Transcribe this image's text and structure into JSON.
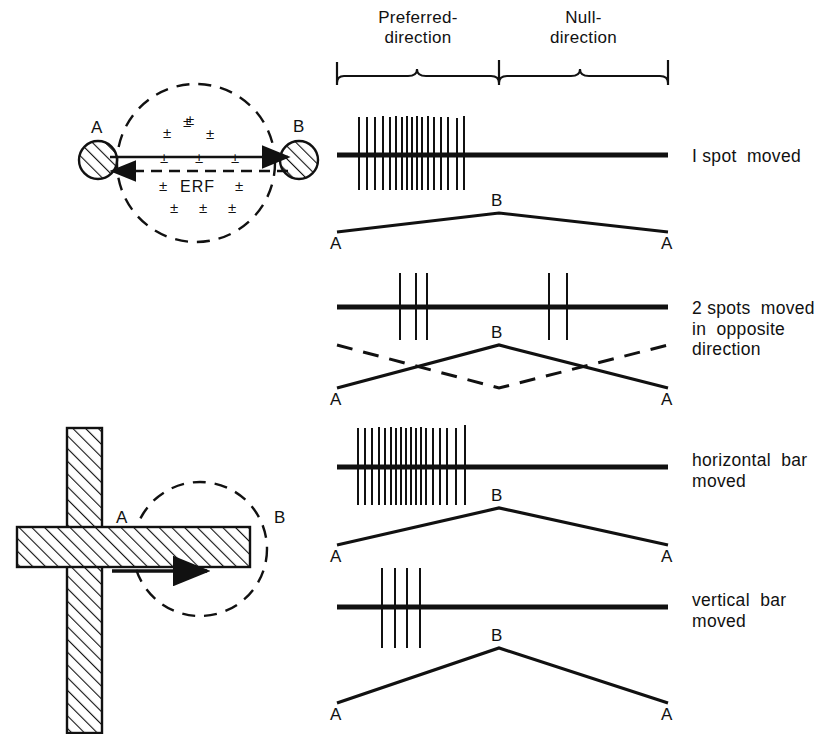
{
  "figure": {
    "header": {
      "preferred_label": "Preferred-\ndirection",
      "null_label": "Null-\ndirection"
    },
    "erf_diagram": {
      "label_a": "A",
      "label_b": "B",
      "erf_text": "ERF",
      "pm_symbol": "±",
      "pm_count": 12,
      "pm_positions": [
        {
          "x": 183,
          "y": 113
        },
        {
          "x": 163,
          "y": 124
        },
        {
          "x": 206,
          "y": 125
        },
        {
          "x": 160,
          "y": 149
        },
        {
          "x": 195,
          "y": 149
        },
        {
          "x": 231,
          "y": 149
        },
        {
          "x": 159,
          "y": 177
        },
        {
          "x": 235,
          "y": 177
        },
        {
          "x": 170,
          "y": 199
        },
        {
          "x": 199,
          "y": 199
        },
        {
          "x": 228,
          "y": 199
        },
        {
          "x": 186,
          "y": 111
        }
      ]
    },
    "cross_diagram": {
      "label_a": "A",
      "label_b": "B"
    },
    "traces": [
      {
        "caption": "I spot  moved",
        "label_a_left": "A",
        "label_a_right": "A",
        "label_b": "B",
        "spike_count": 17,
        "spikes": [
          359,
          367,
          375,
          383,
          390,
          396,
          402,
          407,
          412,
          417,
          422,
          428,
          434,
          441,
          448,
          457,
          464
        ],
        "trajectory": "peak",
        "has_dashed": false
      },
      {
        "caption": "2 spots  moved\nin  opposite\ndirection",
        "label_a_left": "A",
        "label_a_right": "A",
        "label_b": "B",
        "spike_count": 5,
        "spikes": [
          400,
          416,
          427,
          549,
          567
        ],
        "trajectory": "peak",
        "has_dashed": true
      },
      {
        "caption": "horizontal  bar\nmoved",
        "label_a_left": "A",
        "label_a_right": "A",
        "label_b": "B",
        "spike_count": 18,
        "spikes": [
          358,
          365,
          372,
          379,
          385,
          391,
          396,
          401,
          406,
          411,
          416,
          421,
          426,
          433,
          440,
          447,
          456,
          465
        ],
        "trajectory": "peak",
        "has_dashed": false
      },
      {
        "caption": "vertical  bar\nmoved",
        "label_a_left": "A",
        "label_a_right": "A",
        "label_b": "B",
        "spike_count": 4,
        "spikes": [
          382,
          395,
          407,
          420
        ],
        "trajectory": "peak",
        "has_dashed": false
      }
    ]
  }
}
